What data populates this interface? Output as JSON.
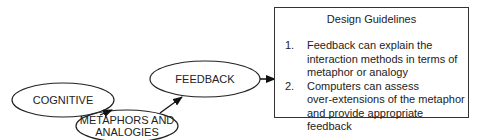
{
  "diagram": {
    "nodes": [
      {
        "id": "cognitive",
        "label": "COGNITIVE"
      },
      {
        "id": "metaphors",
        "label": "METAPHORS AND\nANALOGIES"
      },
      {
        "id": "feedback",
        "label": "FEEDBACK"
      }
    ],
    "edges": [
      {
        "from": "cognitive",
        "to": "metaphors"
      },
      {
        "from": "metaphors",
        "to": "feedback"
      },
      {
        "from": "feedback",
        "to": "design-guidelines"
      }
    ],
    "guidelines": {
      "title": "Design Guidelines",
      "items": [
        {
          "num": "1.",
          "text": "Feedback can explain the\ninteraction methods in terms of\nmetaphor or analogy"
        },
        {
          "num": "2.",
          "text": "Computers can assess\nover-extensions of the metaphor\nand provide appropriate feedback"
        }
      ]
    }
  }
}
